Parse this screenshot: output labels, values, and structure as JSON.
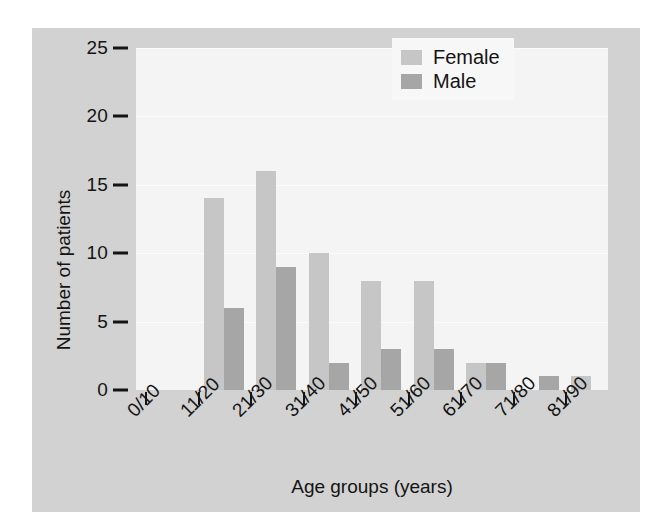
{
  "chart_data": {
    "type": "bar",
    "title": "",
    "subtitle": "",
    "xlabel": "Age groups (years)",
    "ylabel": "Number of patients",
    "categories": [
      "0/10",
      "11/20",
      "21/30",
      "31/40",
      "41/50",
      "51/60",
      "61/70",
      "71/80",
      "81/90"
    ],
    "series": [
      {
        "name": "Female",
        "color": "#c6c6c6",
        "values": [
          0,
          14,
          16,
          10,
          8,
          8,
          2,
          0,
          1
        ]
      },
      {
        "name": "Male",
        "color": "#a6a6a6",
        "values": [
          0,
          6,
          9,
          2,
          3,
          3,
          2,
          1,
          0
        ]
      }
    ],
    "ylim": [
      0,
      25
    ],
    "yticks": [
      0,
      5,
      10,
      15,
      20,
      25
    ],
    "ytick_labels": [
      "0",
      "5",
      "10",
      "15",
      "20",
      "25"
    ],
    "grid": true,
    "grid_axis": "y",
    "legend_position": "top-right",
    "bar_grouping": "grouped"
  },
  "figure": {
    "background_color": "#d2d2d2",
    "plot_background_color": "#f4f4f4",
    "axis_color": "#141414"
  },
  "legend": {
    "entries": [
      {
        "label": "Female",
        "swatch": "female-swatch"
      },
      {
        "label": "Male",
        "swatch": "male-swatch"
      }
    ]
  }
}
